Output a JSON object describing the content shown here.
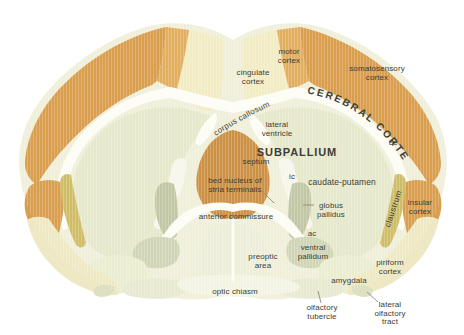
{
  "figure": {
    "kind": "brain coronal section diagram",
    "main_region": "SUBPALLIUM"
  },
  "colors": {
    "background": "#ffffff",
    "base_cream": "#f0efda",
    "cortex_orange": "#d99e4e",
    "motor_orange": "#e2ae60",
    "septum_orange": "#cc9145",
    "cingulate_pale": "#f1ecc4",
    "caudate_pale": "#e6e8cc",
    "claustrum_mustard": "#cfbd68",
    "insular_orange": "#d99f50",
    "globus_pallidus_olive": "#c2c7a6",
    "ventral_pallidum_olive": "#d0d5b6",
    "amygdala_pale": "#ebedd0",
    "piriform_pale": "#eee9c4",
    "tubercle_pale": "#e7ead0",
    "white_matter": "#fdfdf6",
    "optic_chiasm_pale": "#f3f4e4",
    "label_text": "#3e3d35",
    "leader_line": "#8b8b7d"
  },
  "labels": {
    "cerebral_cortex": "CEREBRAL CORTEX",
    "corpus_callosum": "corpus callosum",
    "subpallium": "SUBPALLIUM",
    "motor_cortex": [
      "motor",
      "cortex"
    ],
    "cingulate_cortex": [
      "cingulate",
      "cortex"
    ],
    "somatosensory_cortex": [
      "somatosensory",
      "cortex"
    ],
    "lateral_ventricle": [
      "lateral",
      "ventricle"
    ],
    "septum": "septum",
    "bed_nucleus": [
      "bed nucleus of",
      "stria terminalis"
    ],
    "ic": "ic",
    "ec": "ec",
    "ac": "ac",
    "caudate_putamen": "caudate-putamen",
    "globus_pallidus": [
      "globus",
      "pallidus"
    ],
    "anterior_commissure": "anterior commissure",
    "ventral_pallidum": [
      "ventral",
      "pallidum"
    ],
    "preoptic_area": [
      "preoptic",
      "area"
    ],
    "insular_cortex": [
      "insular",
      "cortex"
    ],
    "claustrum": "claustrum",
    "piriform_cortex": [
      "piriform",
      "cortex"
    ],
    "amygdala": "amygdala",
    "optic_chiasm": "optic chiasm",
    "olfactory_tubercle": [
      "olfactory",
      "tubercle"
    ],
    "lateral_olfactory_tract": [
      "lateral",
      "olfactory",
      "tract"
    ]
  }
}
